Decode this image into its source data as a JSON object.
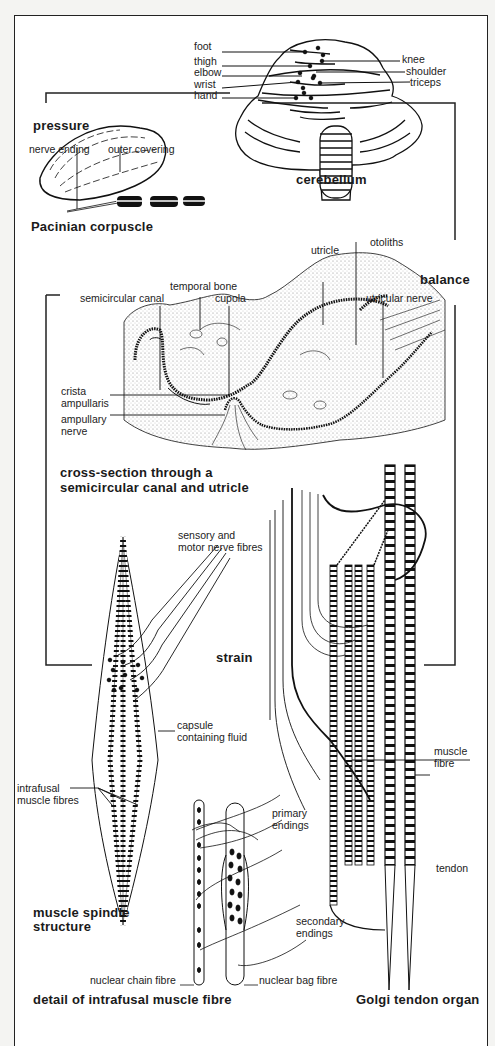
{
  "cerebellum": {
    "title": "cerebellum",
    "left_labels": [
      "foot",
      "thigh",
      "elbow",
      "wrist",
      "hand"
    ],
    "right_labels": [
      "knee",
      "shoulder",
      "triceps"
    ]
  },
  "sections": {
    "pressure": "pressure",
    "balance": "balance",
    "strain": "strain"
  },
  "pacinian": {
    "title": "Pacinian corpuscle",
    "labels": [
      "nerve ending",
      "outer covering"
    ]
  },
  "canal": {
    "title_line1": "cross-section through a",
    "title_line2": "semicircular canal and utricle",
    "labels": {
      "otoliths": "otoliths",
      "utricle": "utricle",
      "temporal_bone": "temporal bone",
      "semicircular_canal": "semicircular canal",
      "cupola": "cupola",
      "utricular_nerve": "utricular nerve",
      "crista_1": "crista",
      "crista_2": "ampullaris",
      "ampullary_1": "ampullary",
      "ampullary_2": "nerve"
    }
  },
  "spindle": {
    "title_line1": "muscle spindle",
    "title_line2": "structure",
    "labels": {
      "nerve_1": "sensory and",
      "nerve_2": "motor nerve fibres",
      "capsule_1": "capsule",
      "capsule_2": "containing fluid",
      "intrafusal_1": "intrafusal",
      "intrafusal_2": "muscle fibres"
    }
  },
  "intrafusal": {
    "title": "detail of intrafusal muscle fibre",
    "labels": {
      "primary_1": "primary",
      "primary_2": "endings",
      "secondary_1": "secondary",
      "secondary_2": "endings",
      "chain": "nuclear chain fibre",
      "bag": "nuclear bag fibre"
    }
  },
  "golgi": {
    "title": "Golgi tendon organ",
    "labels": {
      "muscle_1": "muscle",
      "muscle_2": "fibre",
      "tendon": "tendon"
    }
  }
}
